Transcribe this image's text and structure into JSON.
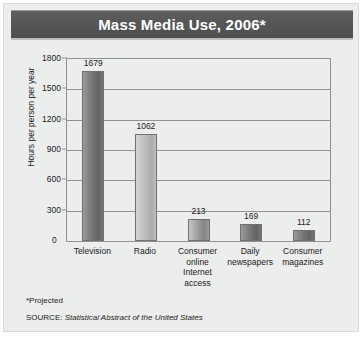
{
  "title": "Mass Media Use, 2006*",
  "footnote": "*Projected",
  "source": {
    "prefix": "SOURCE:",
    "title": "Statistical Abstract of the United States"
  },
  "axis": {
    "y_title": "Hours per person per year",
    "zero_label": "0"
  },
  "colors": {
    "title_bar": "#565656",
    "title_text": "#ffffff",
    "card_background": "#eceded",
    "plot_border": "#8f9192",
    "bar_dark": "#6f7071",
    "bar_light": "#b6b7b8",
    "text": "#1b1b1b"
  },
  "chart_data": {
    "type": "bar",
    "title": "Mass Media Use, 2006*",
    "xlabel": "",
    "ylabel": "Hours per person per year",
    "ylim": [
      0,
      1800
    ],
    "yticks": [
      0,
      300,
      600,
      900,
      1200,
      1500,
      1800
    ],
    "ytick_labels": [
      "0",
      "300",
      "600",
      "900",
      "1200",
      "1500",
      "1800"
    ],
    "grid": true,
    "legend": "none",
    "categories": [
      "Television",
      "Radio",
      "Consumer online Internet access",
      "Daily newspapers",
      "Consumer magazines"
    ],
    "category_lines": [
      [
        "Television"
      ],
      [
        "Radio"
      ],
      [
        "Consumer",
        "online",
        "Internet",
        "access"
      ],
      [
        "Daily",
        "newspapers"
      ],
      [
        "Consumer",
        "magazines"
      ]
    ],
    "values": [
      1679,
      1062,
      213,
      169,
      112
    ],
    "value_labels": [
      "1679",
      "1062",
      "213",
      "169",
      "112"
    ],
    "bar_shades": [
      "dark",
      "light",
      "mid",
      "dark",
      "dark"
    ],
    "notes": [
      "*Projected",
      "SOURCE: Statistical Abstract of the United States"
    ]
  }
}
